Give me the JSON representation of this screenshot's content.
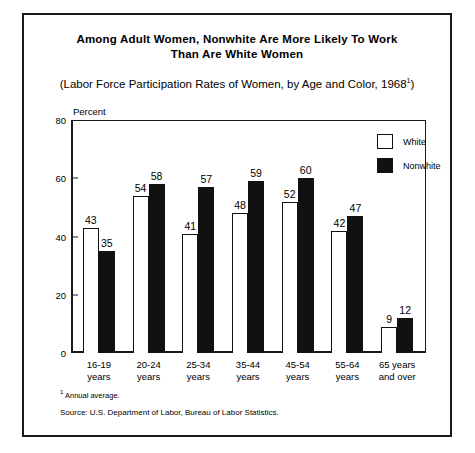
{
  "chart_data": {
    "type": "bar",
    "title": "Among Adult Women, Nonwhite Are More Likely To Work Than Are White Women",
    "title_line1": "Among Adult Women, Nonwhite Are More Likely To Work",
    "title_line2": "Than Are White Women",
    "subtitle": "(Labor Force Participation Rates of Women, by Age and Color, 1968",
    "subtitle_marker": "1",
    "subtitle_close": ")",
    "xlabel": "",
    "ylabel": "Percent",
    "ylim": [
      0,
      80
    ],
    "yticks": [
      0,
      20,
      40,
      60,
      80
    ],
    "grid": false,
    "legend_position": "top-right",
    "categories": [
      "16-19\nyears",
      "20-24\nyears",
      "25-34\nyears",
      "35-44\nyears",
      "45-54\nyears",
      "55-64\nyears",
      "65 years\nand over"
    ],
    "category_lines": [
      [
        "16-19",
        "years"
      ],
      [
        "20-24",
        "years"
      ],
      [
        "25-34",
        "years"
      ],
      [
        "35-44",
        "years"
      ],
      [
        "45-54",
        "years"
      ],
      [
        "55-64",
        "years"
      ],
      [
        "65 years",
        "and over"
      ]
    ],
    "series": [
      {
        "name": "White",
        "color": "#ffffff",
        "values": [
          43,
          54,
          41,
          48,
          52,
          42,
          9
        ]
      },
      {
        "name": "Nonwhite",
        "color": "#111111",
        "values": [
          35,
          58,
          57,
          59,
          60,
          47,
          12
        ]
      }
    ],
    "footnotes": [
      "Annual average.",
      "Source: U.S. Department of Labor, Bureau of Labor Statistics."
    ]
  },
  "legend": {
    "items": [
      {
        "label": "White"
      },
      {
        "label": "Nonwhite"
      }
    ]
  },
  "footnotes": {
    "annual_marker": "1",
    "annual": "Annual average.",
    "source": "Source: U.S. Department of Labor, Bureau of Labor Statistics."
  },
  "colors": {
    "ink": "#111111",
    "paper": "#ffffff"
  }
}
